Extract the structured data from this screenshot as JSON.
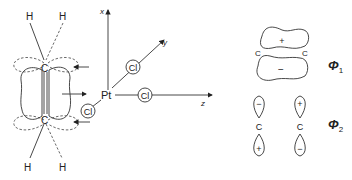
{
  "left_diagram": {
    "atoms": {
      "h_top_left": "H",
      "h_top_right": "H",
      "c_top": "C",
      "c_bottom": "C",
      "h_bottom_left": "H",
      "h_bottom_right": "H",
      "pt": "Pt"
    },
    "ligands": [
      "Cl",
      "Cl",
      "Cl"
    ],
    "axes": {
      "x": "x",
      "y": "y",
      "z": "z"
    }
  },
  "right_diagram": {
    "phi1": {
      "label": "Φ",
      "sub": "1",
      "plus": "+",
      "minus": "−",
      "c_left": "C",
      "c_right": "C"
    },
    "phi2": {
      "label": "Φ",
      "sub": "2",
      "left": {
        "top": "−",
        "c": "C",
        "bottom": "+"
      },
      "right": {
        "top": "+",
        "c": "C",
        "bottom": "−"
      }
    }
  }
}
